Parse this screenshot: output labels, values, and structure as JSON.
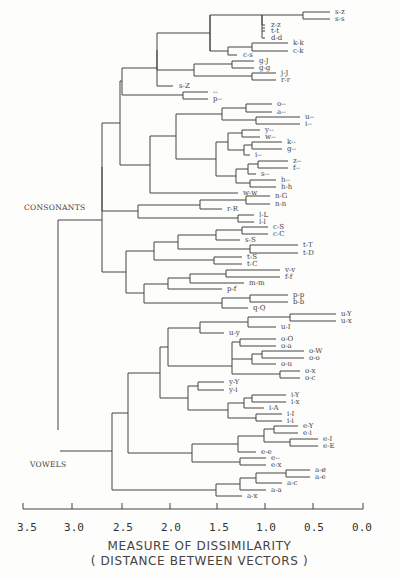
{
  "chart_data": {
    "type": "dendrogram",
    "title": "",
    "xlabel": "MEASURE OF DISSIMILARITY",
    "xlabel_sub": "( DISTANCE BETWEEN VECTORS )",
    "x_ticks": [
      "3.5",
      "3.0",
      "2.5",
      "2.0",
      "1.5",
      "1.0",
      "0.5",
      "0.0"
    ],
    "xlim": [
      3.5,
      0.0
    ],
    "groups": [
      {
        "label": "CONSONANTS"
      },
      {
        "label": "VOWELS"
      }
    ],
    "leaves": [
      {
        "label": "s-z",
        "y": 12,
        "x": 332
      },
      {
        "label": "s-s",
        "y": 19,
        "x": 332
      },
      {
        "label": "z-z",
        "y": 25,
        "x": 268
      },
      {
        "label": "t-t",
        "y": 31,
        "x": 268
      },
      {
        "label": "d-d",
        "y": 38,
        "x": 268
      },
      {
        "label": "k-k",
        "y": 43,
        "x": 290
      },
      {
        "label": "c-k",
        "y": 51,
        "x": 290
      },
      {
        "label": "c-s",
        "y": 55,
        "x": 240
      },
      {
        "label": "g-J",
        "y": 61,
        "x": 256
      },
      {
        "label": "g-g",
        "y": 68,
        "x": 256
      },
      {
        "label": "j-J",
        "y": 73,
        "x": 278
      },
      {
        "label": "r-r",
        "y": 80,
        "x": 278
      },
      {
        "label": "s-Z",
        "y": 86,
        "x": 176
      },
      {
        "label": "--",
        "y": 92,
        "x": 210
      },
      {
        "label": "p--",
        "y": 99,
        "x": 210
      },
      {
        "label": "o--",
        "y": 104,
        "x": 274
      },
      {
        "label": "a--",
        "y": 112,
        "x": 274
      },
      {
        "label": "u--",
        "y": 117,
        "x": 302
      },
      {
        "label": "i--",
        "y": 124,
        "x": 302
      },
      {
        "label": "y--",
        "y": 130,
        "x": 262
      },
      {
        "label": "w--",
        "y": 137,
        "x": 262
      },
      {
        "label": "k--",
        "y": 142,
        "x": 284
      },
      {
        "label": "g--",
        "y": 149,
        "x": 284
      },
      {
        "label": "i--",
        "y": 155,
        "x": 252
      },
      {
        "label": "z--",
        "y": 161,
        "x": 290
      },
      {
        "label": "f--",
        "y": 168,
        "x": 290
      },
      {
        "label": "s--",
        "y": 174,
        "x": 258
      },
      {
        "label": "h--",
        "y": 180,
        "x": 278
      },
      {
        "label": "h-h",
        "y": 187,
        "x": 278
      },
      {
        "label": "w-w",
        "y": 193,
        "x": 240
      },
      {
        "label": "n-G",
        "y": 196,
        "x": 272
      },
      {
        "label": "n-n",
        "y": 204,
        "x": 272
      },
      {
        "label": "r-R",
        "y": 209,
        "x": 224
      },
      {
        "label": "l-L",
        "y": 215,
        "x": 256
      },
      {
        "label": "l-l",
        "y": 222,
        "x": 256
      },
      {
        "label": "c-S",
        "y": 227,
        "x": 270
      },
      {
        "label": "c-C",
        "y": 234,
        "x": 270
      },
      {
        "label": "s-S",
        "y": 240,
        "x": 242
      },
      {
        "label": "t-T",
        "y": 245,
        "x": 300
      },
      {
        "label": "t-D",
        "y": 253,
        "x": 300
      },
      {
        "label": "t-S",
        "y": 257,
        "x": 244
      },
      {
        "label": "t-C",
        "y": 264,
        "x": 244
      },
      {
        "label": "v-v",
        "y": 270,
        "x": 282
      },
      {
        "label": "f-f",
        "y": 277,
        "x": 282
      },
      {
        "label": "m-m",
        "y": 283,
        "x": 246
      },
      {
        "label": "p-f",
        "y": 289,
        "x": 224
      },
      {
        "label": "p-p",
        "y": 295,
        "x": 290
      },
      {
        "label": "b-b",
        "y": 302,
        "x": 290
      },
      {
        "label": "q-Q",
        "y": 308,
        "x": 250
      },
      {
        "label": "u-Y",
        "y": 314,
        "x": 338
      },
      {
        "label": "u-x",
        "y": 321,
        "x": 338
      },
      {
        "label": "u-y",
        "y": 333,
        "x": 226
      },
      {
        "label": "u-I",
        "y": 327,
        "x": 278
      },
      {
        "label": "o-O",
        "y": 339,
        "x": 278
      },
      {
        "label": "o-a",
        "y": 346,
        "x": 278
      },
      {
        "label": "o-W",
        "y": 351,
        "x": 306
      },
      {
        "label": "o-o",
        "y": 358,
        "x": 306
      },
      {
        "label": "o-u",
        "y": 364,
        "x": 278
      },
      {
        "label": "o-x",
        "y": 371,
        "x": 302
      },
      {
        "label": "o-c",
        "y": 378,
        "x": 302
      },
      {
        "label": "y-Y",
        "y": 382,
        "x": 226
      },
      {
        "label": "y-i",
        "y": 390,
        "x": 226
      },
      {
        "label": "i-Y",
        "y": 395,
        "x": 288
      },
      {
        "label": "i-x",
        "y": 402,
        "x": 288
      },
      {
        "label": "i-A",
        "y": 408,
        "x": 266
      },
      {
        "label": "i-I",
        "y": 414,
        "x": 284
      },
      {
        "label": "i-i",
        "y": 421,
        "x": 284
      },
      {
        "label": "e-Y",
        "y": 426,
        "x": 300
      },
      {
        "label": "e-i",
        "y": 433,
        "x": 300
      },
      {
        "label": "e-I",
        "y": 439,
        "x": 320
      },
      {
        "label": "e-E",
        "y": 446,
        "x": 320
      },
      {
        "label": "e-e",
        "y": 452,
        "x": 258
      },
      {
        "label": "e--",
        "y": 458,
        "x": 268
      },
      {
        "label": "e-x",
        "y": 465,
        "x": 268
      },
      {
        "label": "a-ø",
        "y": 470,
        "x": 312
      },
      {
        "label": "a-e",
        "y": 477,
        "x": 312
      },
      {
        "label": "a-c",
        "y": 483,
        "x": 284
      },
      {
        "label": "a-a",
        "y": 490,
        "x": 268
      },
      {
        "label": "a-x",
        "y": 496,
        "x": 244
      }
    ]
  }
}
